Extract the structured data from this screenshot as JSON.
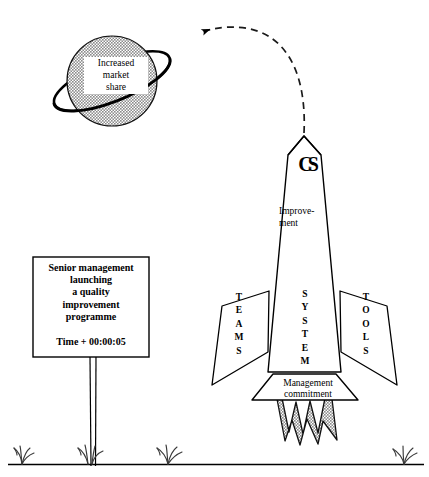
{
  "diagram": {
    "title": "Senior management launching a quality improvement programme",
    "colors": {
      "ink": "#000000",
      "planet_fill": "#a9a9a9",
      "flame_fill": "#9e9e9e",
      "background": "#ffffff"
    }
  },
  "planet": {
    "label_lines": [
      "Increased",
      "market",
      "share"
    ],
    "label_text": "Increased\nmarket\nshare",
    "ring_name": "orbit-ring"
  },
  "trajectory": {
    "style": "dashed",
    "arrow_direction": "left",
    "name": "flight-path"
  },
  "sign": {
    "body_lines": [
      "Senior management",
      "launching",
      "a quality",
      "improvement",
      "programme"
    ],
    "body_text": "Senior management\nlaunching\na quality\nimprovement\nprogramme",
    "time_label": "Time + 00:00:05"
  },
  "rocket": {
    "logo": "CS",
    "nose_label": "Improve-\nment",
    "nose_label_lines": [
      "Improve-",
      "ment"
    ],
    "body_label": "SYSTEM",
    "body_label_vertical": "S\nY\nS\nT\nE\nM",
    "fin_left_label": "TEAMS",
    "fin_left_vertical": "T\nE\nA\nM\nS",
    "fin_right_label": "TOOLS",
    "fin_right_vertical": "T\nO\nO\nL\nS",
    "nozzle_label": "Management\ncommitment",
    "nozzle_label_lines": [
      "Management",
      "commitment"
    ],
    "exhaust_name": "rocket-flames"
  },
  "ground": {
    "line_name": "ground-line",
    "grass_count": 4
  }
}
